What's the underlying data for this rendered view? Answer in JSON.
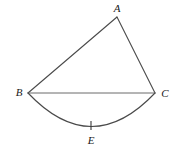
{
  "figure": {
    "type": "geometry-diagram",
    "background_color": "#ffffff",
    "stroke_color": "#4a4a4a",
    "label_color": "#1a1a1a",
    "width": 179,
    "height": 154,
    "points": [
      {
        "id": "A",
        "label": "A",
        "x": 117,
        "y": 17,
        "label_x": 117,
        "label_y": 8
      },
      {
        "id": "B",
        "label": "B",
        "x": 28,
        "y": 93,
        "label_x": 19,
        "label_y": 92
      },
      {
        "id": "C",
        "label": "C",
        "x": 155,
        "y": 93,
        "label_x": 165,
        "label_y": 93
      },
      {
        "id": "E",
        "label": "E",
        "x": 91,
        "y": 126,
        "label_x": 91,
        "label_y": 140
      }
    ],
    "segments": [
      {
        "id": "AB",
        "from": "B",
        "to": "A",
        "x1": 28,
        "y1": 93,
        "x2": 117,
        "y2": 17
      },
      {
        "id": "AC",
        "from": "A",
        "to": "C",
        "x1": 117,
        "y1": 17,
        "x2": 155,
        "y2": 93
      },
      {
        "id": "BC",
        "from": "B",
        "to": "C",
        "x1": 28,
        "y1": 93,
        "x2": 155,
        "y2": 93
      }
    ],
    "arcs": [
      {
        "id": "arc-BEC",
        "from": "B",
        "to": "C",
        "through": "E",
        "path": "M 28 93 Q 91.5 160 155 93",
        "bulge_direction": "down"
      }
    ],
    "ticks": [
      {
        "id": "tick-E",
        "x": 91,
        "y1": 121,
        "y2": 130
      }
    ]
  }
}
